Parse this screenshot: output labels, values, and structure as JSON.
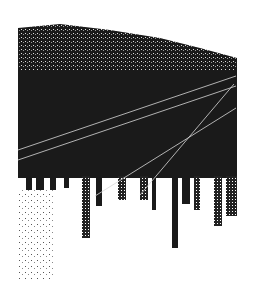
{
  "artwork": {
    "subject": "inverted city skyline with converging light lines",
    "colors": {
      "background": "#ffffff",
      "ink": "#1a1a1a",
      "line": "#d8d8d8"
    },
    "bounds": {
      "x": 18,
      "y": 22,
      "width": 219,
      "height": 258
    },
    "lines": [
      {
        "x1": 18,
        "y1": 150,
        "x2": 236,
        "y2": 76
      },
      {
        "x1": 18,
        "y1": 160,
        "x2": 236,
        "y2": 86
      },
      {
        "x1": 95,
        "y1": 196,
        "x2": 236,
        "y2": 108
      },
      {
        "x1": 140,
        "y1": 195,
        "x2": 234,
        "y2": 84
      }
    ]
  }
}
